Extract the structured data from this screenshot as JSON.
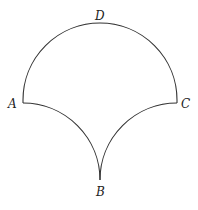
{
  "diagram": {
    "points": {
      "A": {
        "label": "A",
        "x": 23,
        "y": 103
      },
      "B": {
        "label": "B",
        "x": 100,
        "y": 180
      },
      "C": {
        "label": "C",
        "x": 177,
        "y": 103
      },
      "D": {
        "label": "D",
        "x": 100,
        "y": 25
      }
    },
    "stroke_color": "#333333",
    "label_color": "#222222"
  }
}
